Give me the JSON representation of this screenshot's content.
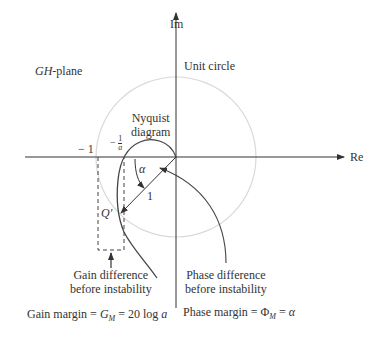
{
  "diagram": {
    "plane_label_italic": "GH",
    "plane_label_rest": "-plane",
    "axes": {
      "real": "Re",
      "imaginary": "Im"
    },
    "unit_circle_label": "Unit circle",
    "nyquist_label": [
      "Nyquist",
      "diagram"
    ],
    "minus_one": "− 1",
    "minus_inv_a": {
      "sign": "−",
      "num": "1",
      "den": "a"
    },
    "alpha": "α",
    "one": "1",
    "q_prime": "Q′",
    "gain_difference": [
      "Gain difference",
      "before instability"
    ],
    "phase_difference": [
      "Phase difference",
      "before instability"
    ],
    "gain_margin": {
      "prefix": "Gain margin = ",
      "sym": "G",
      "sub": "M",
      "rest": " = 20 log ",
      "var": "a"
    },
    "phase_margin": {
      "prefix": "Phase margin = ",
      "sym": "Φ",
      "sub": "M",
      "rest": " = ",
      "var": "α"
    },
    "colors": {
      "line": "#333333",
      "unit_circle": "#d9d9d9"
    }
  }
}
